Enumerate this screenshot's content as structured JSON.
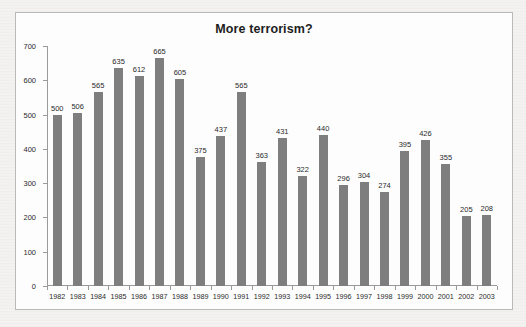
{
  "page": {
    "background_color": "#f3f2f0"
  },
  "chart_frame": {
    "border_color": "#b9b9b7",
    "background_color": "#fdfdfd"
  },
  "chart_data": {
    "type": "bar",
    "title": "More terrorism?",
    "xlabel": "",
    "ylabel": "",
    "categories": [
      "1982",
      "1983",
      "1984",
      "1985",
      "1986",
      "1987",
      "1988",
      "1989",
      "1990",
      "1991",
      "1992",
      "1993",
      "1994",
      "1995",
      "1996",
      "1997",
      "1998",
      "1999",
      "2000",
      "2001",
      "2002",
      "2003"
    ],
    "values": [
      500,
      506,
      565,
      635,
      612,
      665,
      605,
      375,
      437,
      565,
      363,
      431,
      322,
      440,
      296,
      304,
      274,
      395,
      426,
      355,
      205,
      208
    ],
    "value_labels": [
      "500",
      "506",
      "565",
      "635",
      "612",
      "665",
      "605",
      "375",
      "437",
      "565",
      "363",
      "431",
      "322",
      "440",
      "296",
      "304",
      "274",
      "395",
      "426",
      "355",
      "205",
      "208"
    ],
    "ylim": [
      0,
      700
    ],
    "y_ticks": [
      0,
      100,
      200,
      300,
      400,
      500,
      600,
      700
    ],
    "y_tick_labels": [
      "0",
      "100",
      "200",
      "300",
      "400",
      "500",
      "600",
      "700"
    ],
    "grid": false,
    "legend": null,
    "series_color": "#7e7e7e",
    "data_labels_shown": true
  }
}
